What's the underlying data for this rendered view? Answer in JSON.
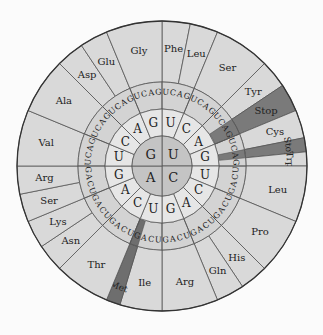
{
  "diagram": {
    "center": {
      "x": 162,
      "y": 166
    },
    "radii": {
      "inner": 30,
      "second": 57,
      "third": 84,
      "outer": 145
    },
    "colors": {
      "background": "#fbfbfb",
      "inner": "#c4c4c4",
      "second": "#e6e6e6",
      "third": "#d3d3d3",
      "outer": "#d9d9d9",
      "stop": "#7a7a7a",
      "met": "#6e6e6e",
      "line": "#555555"
    },
    "first_bases": [
      {
        "base": "U",
        "start": 0
      },
      {
        "base": "C",
        "start": 90
      },
      {
        "base": "A",
        "start": 180
      },
      {
        "base": "G",
        "start": 270
      }
    ],
    "second_bases": [
      "U",
      "C",
      "A",
      "G"
    ],
    "third_bases": [
      "U",
      "C",
      "A",
      "G"
    ],
    "amino_acids": [
      {
        "label": "Phe",
        "first": "U",
        "second": "U",
        "thirds": [
          "U",
          "C"
        ]
      },
      {
        "label": "Leu",
        "first": "U",
        "second": "U",
        "thirds": [
          "A",
          "G"
        ]
      },
      {
        "label": "Ser",
        "first": "U",
        "second": "C",
        "thirds": [
          "U",
          "C",
          "A",
          "G"
        ]
      },
      {
        "label": "Tyr",
        "first": "U",
        "second": "A",
        "thirds": [
          "U",
          "C"
        ]
      },
      {
        "label": "Stop",
        "first": "U",
        "second": "A",
        "thirds": [
          "A",
          "G"
        ],
        "highlight": "stop"
      },
      {
        "label": "Cys",
        "first": "U",
        "second": "G",
        "thirds": [
          "U",
          "C"
        ]
      },
      {
        "label": "Stop",
        "first": "U",
        "second": "G",
        "thirds": [
          "A"
        ],
        "highlight": "stop"
      },
      {
        "label": "Trp",
        "first": "U",
        "second": "G",
        "thirds": [
          "G"
        ]
      },
      {
        "label": "Leu",
        "first": "C",
        "second": "U",
        "thirds": [
          "U",
          "C",
          "A",
          "G"
        ]
      },
      {
        "label": "Pro",
        "first": "C",
        "second": "C",
        "thirds": [
          "U",
          "C",
          "A",
          "G"
        ]
      },
      {
        "label": "His",
        "first": "C",
        "second": "A",
        "thirds": [
          "U",
          "C"
        ]
      },
      {
        "label": "Gln",
        "first": "C",
        "second": "A",
        "thirds": [
          "A",
          "G"
        ]
      },
      {
        "label": "Arg",
        "first": "C",
        "second": "G",
        "thirds": [
          "U",
          "C",
          "A",
          "G"
        ]
      },
      {
        "label": "Ile",
        "first": "A",
        "second": "U",
        "thirds": [
          "U",
          "C",
          "A"
        ]
      },
      {
        "label": "Met",
        "first": "A",
        "second": "U",
        "thirds": [
          "G"
        ],
        "highlight": "met"
      },
      {
        "label": "Thr",
        "first": "A",
        "second": "C",
        "thirds": [
          "U",
          "C",
          "A",
          "G"
        ]
      },
      {
        "label": "Asn",
        "first": "A",
        "second": "A",
        "thirds": [
          "U",
          "C"
        ]
      },
      {
        "label": "Lys",
        "first": "A",
        "second": "A",
        "thirds": [
          "A",
          "G"
        ]
      },
      {
        "label": "Ser",
        "first": "A",
        "second": "G",
        "thirds": [
          "U",
          "C"
        ]
      },
      {
        "label": "Arg",
        "first": "A",
        "second": "G",
        "thirds": [
          "A",
          "G"
        ]
      },
      {
        "label": "Val",
        "first": "G",
        "second": "U",
        "thirds": [
          "U",
          "C",
          "A",
          "G"
        ]
      },
      {
        "label": "Ala",
        "first": "G",
        "second": "C",
        "thirds": [
          "U",
          "C",
          "A",
          "G"
        ]
      },
      {
        "label": "Asp",
        "first": "G",
        "second": "A",
        "thirds": [
          "U",
          "C"
        ]
      },
      {
        "label": "Glu",
        "first": "G",
        "second": "A",
        "thirds": [
          "A",
          "G"
        ]
      },
      {
        "label": "Gly",
        "first": "G",
        "second": "G",
        "thirds": [
          "U",
          "C",
          "A",
          "G"
        ]
      }
    ]
  }
}
